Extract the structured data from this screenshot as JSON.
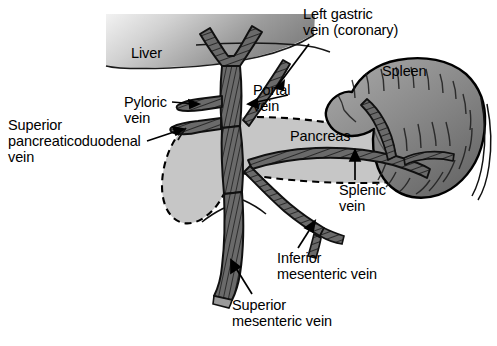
{
  "figure": {
    "width": 497,
    "height": 346,
    "background_color": "#ffffff"
  },
  "organs": [
    {
      "id": "liver",
      "label": "Liver",
      "fill_light": "#e9e9e9",
      "fill_dark": "#8d8d8d",
      "label_x": 131,
      "label_y": 52
    },
    {
      "id": "spleen",
      "label": "Spleen",
      "fill_light": "#b4b4b4",
      "fill_dark": "#6e6e6e",
      "label_x": 382,
      "label_y": 70
    },
    {
      "id": "pancreas",
      "label": "Pancreas",
      "fill": "#c9c9c9",
      "outline_style": "dashed",
      "label_x": 290,
      "label_y": 134
    }
  ],
  "vessel_labels": [
    {
      "id": "left-gastric-vein",
      "text_lines": [
        "Left gastric",
        "vein (coronary)"
      ],
      "x": 303,
      "y": 8,
      "leader": "line"
    },
    {
      "id": "portal-vein",
      "text_lines": [
        "Portal",
        "vein"
      ],
      "x": 253,
      "y": 84,
      "leader": "line"
    },
    {
      "id": "pyloric-vein",
      "text_lines": [
        "Pyloric",
        "vein"
      ],
      "x": 124,
      "y": 96,
      "leader": "arrow"
    },
    {
      "id": "superior-pancreaticoduodenal-vein",
      "text_lines": [
        "Superior",
        "pancreaticoduodenal",
        "vein"
      ],
      "x": 8,
      "y": 118,
      "leader": "arrow"
    },
    {
      "id": "splenic-vein",
      "text_lines": [
        "Splenic",
        "vein"
      ],
      "x": 339,
      "y": 183,
      "leader": "arrow"
    },
    {
      "id": "inferior-mesenteric-vein",
      "text_lines": [
        "Inferior",
        "mesenteric vein"
      ],
      "x": 277,
      "y": 251,
      "leader": "arrow"
    },
    {
      "id": "superior-mesenteric-vein",
      "text_lines": [
        "Superior",
        "mesenteric vein"
      ],
      "x": 232,
      "y": 298,
      "leader": "arrow"
    }
  ],
  "colors": {
    "vessel_fill": "#6b6b6b",
    "vessel_stroke": "#151515",
    "outline": "#000000",
    "text": "#000000"
  },
  "caption": {
    "cut_off_text": ""
  }
}
